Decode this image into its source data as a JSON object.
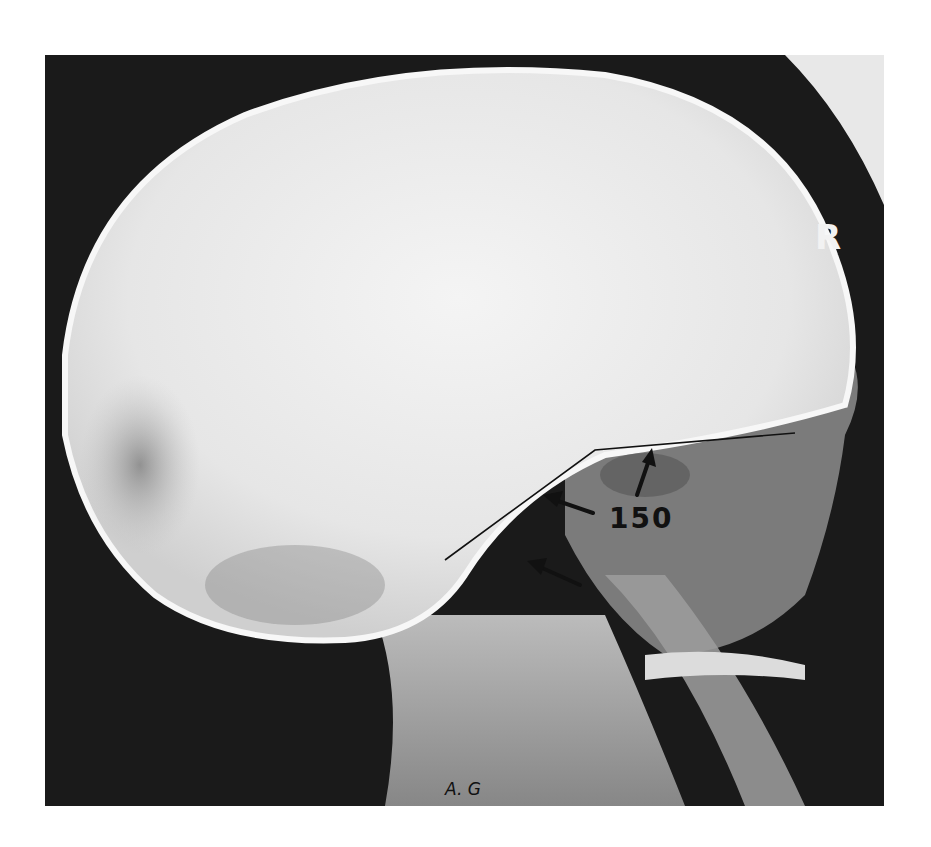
{
  "image": {
    "description": "Lateral skull radiograph with annotated basal angle",
    "annotations": {
      "angle_label": "150",
      "initials": "A. G",
      "side_marker": "R"
    },
    "colors": {
      "background": "#1a1a1a",
      "bone": "#ececec",
      "annotation_ink": "#111111"
    }
  }
}
